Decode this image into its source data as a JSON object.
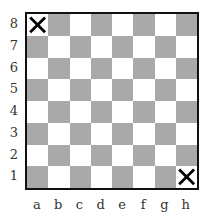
{
  "board": {
    "files": [
      "a",
      "b",
      "c",
      "d",
      "e",
      "f",
      "g",
      "h"
    ],
    "ranks": [
      "8",
      "7",
      "6",
      "5",
      "4",
      "3",
      "2",
      "1"
    ],
    "colors": {
      "dark": "#a9a9a9",
      "light": "#ffffff",
      "border": "#111111"
    },
    "marks": [
      {
        "square": "a8",
        "symbol": "X"
      },
      {
        "square": "h1",
        "symbol": "X"
      }
    ]
  }
}
